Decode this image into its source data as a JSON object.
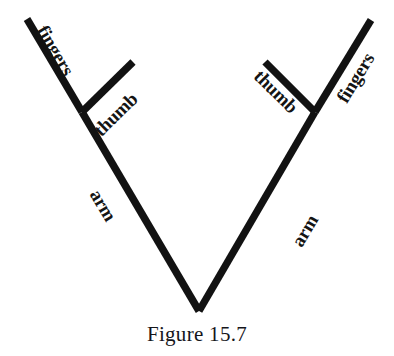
{
  "figure": {
    "caption": "Figure 15.7",
    "background_color": "#ffffff",
    "stroke_color": "#121212",
    "text_color": "#141414",
    "width": 394,
    "height": 356
  },
  "chart_data": {
    "type": "diagram",
    "title": "Figure 15.7",
    "stroke_width": 7.4,
    "nodes": [
      {
        "name": "bottom-vertex",
        "x": 199,
        "y": 311
      },
      {
        "name": "left-junction",
        "x": 82,
        "y": 112
      },
      {
        "name": "right-junction",
        "x": 315,
        "y": 112
      },
      {
        "name": "left-fingers-tip",
        "x": 27,
        "y": 19
      },
      {
        "name": "left-thumb-tip",
        "x": 133,
        "y": 62
      },
      {
        "name": "right-fingers-tip",
        "x": 371,
        "y": 20
      },
      {
        "name": "right-thumb-tip",
        "x": 265,
        "y": 62
      }
    ],
    "segments": [
      {
        "name": "left-arm",
        "label": "arm",
        "from": "bottom-vertex",
        "to": "left-junction",
        "x1": 199,
        "y1": 311,
        "x2": 82,
        "y2": 112
      },
      {
        "name": "left-fingers",
        "label": "fingers",
        "from": "left-junction",
        "to": "left-fingers-tip",
        "x1": 82,
        "y1": 112,
        "x2": 27,
        "y2": 19
      },
      {
        "name": "left-thumb",
        "label": "thumb",
        "from": "left-junction",
        "to": "left-thumb-tip",
        "x1": 82,
        "y1": 112,
        "x2": 133,
        "y2": 62
      },
      {
        "name": "right-arm",
        "label": "arm",
        "from": "bottom-vertex",
        "to": "right-junction",
        "x1": 199,
        "y1": 311,
        "x2": 315,
        "y2": 112
      },
      {
        "name": "right-fingers",
        "label": "fingers",
        "from": "right-junction",
        "to": "right-fingers-tip",
        "x1": 315,
        "y1": 112,
        "x2": 371,
        "y2": 20
      },
      {
        "name": "right-thumb",
        "label": "thumb",
        "from": "right-junction",
        "to": "right-thumb-tip",
        "x1": 315,
        "y1": 112,
        "x2": 265,
        "y2": 62
      }
    ]
  },
  "labels": {
    "left_fingers": "fingers",
    "left_thumb": "thumb",
    "left_arm": "arm",
    "right_fingers": "fingers",
    "right_thumb": "thumb",
    "right_arm": "arm"
  }
}
